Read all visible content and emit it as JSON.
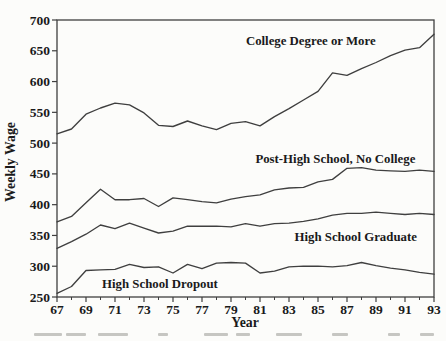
{
  "figure": {
    "background": "#fcfcfa",
    "caption_fully_visible": false
  },
  "chart_data": {
    "type": "line",
    "title": "",
    "xlabel": "Year",
    "ylabel": "Weekly Wage",
    "xlim": [
      67,
      93
    ],
    "ylim": [
      250,
      700
    ],
    "grid": false,
    "legend": "inline-series-labels",
    "line_color": "#3f3f3f",
    "text_color": "#1a1a1a",
    "x": [
      67,
      68,
      69,
      70,
      71,
      72,
      73,
      74,
      75,
      76,
      77,
      78,
      79,
      80,
      81,
      82,
      83,
      84,
      85,
      86,
      87,
      88,
      89,
      90,
      91,
      92,
      93
    ],
    "x_major_ticks": [
      67,
      69,
      71,
      73,
      75,
      77,
      79,
      81,
      83,
      85,
      87,
      89,
      91,
      93
    ],
    "x_minor_ticks": [
      68,
      70,
      72,
      74,
      76,
      78,
      80,
      82,
      84,
      86,
      88,
      90,
      92
    ],
    "y_ticks": [
      250,
      300,
      350,
      400,
      450,
      500,
      550,
      600,
      650,
      700
    ],
    "series": [
      {
        "name": "College Degree or More",
        "label_pos": {
          "x": 84.5,
          "y": 666
        },
        "values": [
          515,
          523,
          547,
          557,
          565,
          562,
          549,
          529,
          527,
          536,
          528,
          522,
          532,
          535,
          528,
          543,
          556,
          570,
          584,
          614,
          610,
          621,
          631,
          642,
          651,
          655,
          677
        ]
      },
      {
        "name": "Post-High School, No College",
        "label_pos": {
          "x": 86.2,
          "y": 474
        },
        "values": [
          372,
          381,
          403,
          425,
          408,
          408,
          410,
          397,
          411,
          408,
          405,
          403,
          409,
          413,
          416,
          424,
          427,
          428,
          437,
          441,
          459,
          460,
          456,
          455,
          454,
          456,
          454
        ]
      },
      {
        "name": "High School Graduate",
        "label_pos": {
          "x": 87.6,
          "y": 348
        },
        "values": [
          329,
          340,
          352,
          367,
          361,
          370,
          362,
          354,
          357,
          365,
          365,
          365,
          364,
          369,
          365,
          369,
          370,
          373,
          377,
          383,
          386,
          386,
          388,
          386,
          384,
          386,
          384
        ]
      },
      {
        "name": "High School Dropout",
        "label_pos": {
          "x": 74.1,
          "y": 271
        },
        "values": [
          256,
          267,
          293,
          294,
          295,
          303,
          298,
          299,
          289,
          303,
          296,
          305,
          306,
          305,
          289,
          292,
          299,
          300,
          300,
          299,
          301,
          306,
          301,
          297,
          294,
          290,
          287
        ]
      }
    ]
  }
}
